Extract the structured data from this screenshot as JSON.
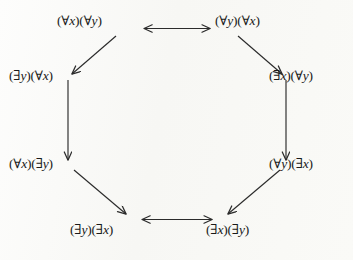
{
  "figure": {
    "type": "diagram",
    "subtype": "octagon-implication-lattice",
    "background_color": "#fbfbf9",
    "line_color": "#2b2b2b",
    "text_color": "#1a1a1a"
  },
  "nodes": [
    {
      "id": "tl",
      "label": "(∀x)(∀y)",
      "position": "top-left",
      "quantifiers": [
        "∀x",
        "∀y"
      ]
    },
    {
      "id": "tr",
      "label": "(∀y)(∀x)",
      "position": "top-right",
      "quantifiers": [
        "∀y",
        "∀x"
      ]
    },
    {
      "id": "lu",
      "label": "(∃y)(∀x)",
      "position": "left-upper",
      "quantifiers": [
        "∃y",
        "∀x"
      ]
    },
    {
      "id": "ru",
      "label": "(∃x)(∀y)",
      "position": "right-upper",
      "quantifiers": [
        "∃x",
        "∀y"
      ]
    },
    {
      "id": "ll",
      "label": "(∀x)(∃y)",
      "position": "left-lower",
      "quantifiers": [
        "∀x",
        "∃y"
      ]
    },
    {
      "id": "rl",
      "label": "(∀y)(∃x)",
      "position": "right-lower",
      "quantifiers": [
        "∀y",
        "∃x"
      ]
    },
    {
      "id": "bl",
      "label": "(∃y)(∃x)",
      "position": "bottom-left",
      "quantifiers": [
        "∃y",
        "∃x"
      ]
    },
    {
      "id": "br",
      "label": "(∃x)(∃y)",
      "position": "bottom-right",
      "quantifiers": [
        "∃x",
        "∃y"
      ]
    }
  ],
  "edges": [
    {
      "from": "tl",
      "to": "tr",
      "direction": "both",
      "name": "edge-top"
    },
    {
      "from": "tl",
      "to": "lu",
      "direction": "forward",
      "name": "edge-upper-left"
    },
    {
      "from": "tr",
      "to": "ru",
      "direction": "forward",
      "name": "edge-upper-right"
    },
    {
      "from": "lu",
      "to": "ll",
      "direction": "forward",
      "name": "edge-left-vertical"
    },
    {
      "from": "ru",
      "to": "rl",
      "direction": "forward",
      "name": "edge-right-vertical"
    },
    {
      "from": "ll",
      "to": "bl",
      "direction": "forward",
      "name": "edge-lower-left"
    },
    {
      "from": "rl",
      "to": "br",
      "direction": "forward",
      "name": "edge-lower-right"
    },
    {
      "from": "bl",
      "to": "br",
      "direction": "both",
      "name": "edge-bottom"
    }
  ]
}
